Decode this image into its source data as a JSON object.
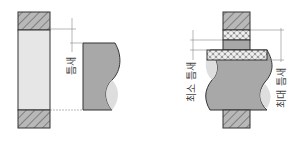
{
  "figure": {
    "left_panel": {
      "label_gap": "틈새"
    },
    "right_panel": {
      "label_min_gap": "최소 틈새",
      "label_max_gap": "최대 틈새"
    }
  },
  "colors": {
    "hatch_fill": "#b8b8b8",
    "hatch_line": "#555555",
    "hole_fill": "#e6e6e6",
    "shaft_fill": "#a8a8a8",
    "shaft_highlight": "#dedede",
    "outline": "#333333",
    "dim_line": "#888888"
  }
}
